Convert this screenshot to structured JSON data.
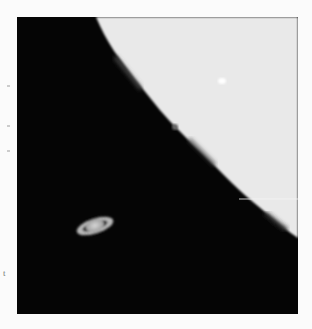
{
  "photo": {
    "subject": "Saturn near the lunar limb",
    "background_color": "#050505",
    "moon_color": "#e8e8e8",
    "planet_color": "#c9c9c9"
  },
  "margin": {
    "clipped_text": "t"
  }
}
